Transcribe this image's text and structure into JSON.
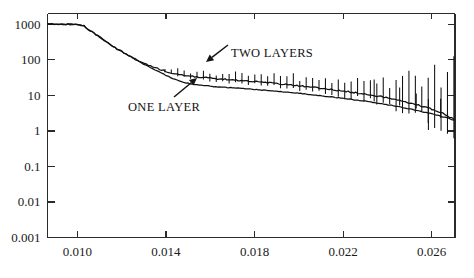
{
  "chart_data": {
    "type": "line",
    "title": "",
    "subtitle": "",
    "xlabel": "",
    "ylabel": "",
    "yscale": "log",
    "xscale": "linear",
    "xlim": [
      0.00865,
      0.02705
    ],
    "ylim": [
      0.001,
      2000
    ],
    "grid": false,
    "legend_position": "inline-annotations",
    "x_ticks": [
      "0.010",
      "0.014",
      "0.018",
      "0.022",
      "0.026"
    ],
    "x_tick_values": [
      0.01,
      0.014,
      0.018,
      0.022,
      0.026
    ],
    "y_ticks": [
      "1000",
      "100",
      "10",
      "1",
      "0.1",
      "0.01",
      "0.001"
    ],
    "y_tick_values": [
      1000,
      100,
      10,
      1,
      0.1,
      0.01,
      0.001
    ],
    "annotations": [
      {
        "text": "ONE LAYER",
        "x": 0.0152,
        "y": 3.4
      },
      {
        "text": "TWO LAYERS",
        "x": 0.0196,
        "y": 175
      }
    ],
    "series": [
      {
        "name": "TWO LAYERS",
        "has_error_bars": true,
        "x": [
          0.00868,
          0.00905,
          0.0094,
          0.00975,
          0.01,
          0.01015,
          0.0103,
          0.0105,
          0.01075,
          0.011,
          0.0113,
          0.0116,
          0.0119,
          0.0122,
          0.0125,
          0.0128,
          0.0131,
          0.0134,
          0.0137,
          0.014,
          0.0143,
          0.0146,
          0.0149,
          0.0152,
          0.0156,
          0.016,
          0.0165,
          0.017,
          0.0175,
          0.018,
          0.0185,
          0.019,
          0.0195,
          0.02,
          0.0206,
          0.0212,
          0.0218,
          0.0224,
          0.023,
          0.0236,
          0.0242,
          0.0248,
          0.0254,
          0.026,
          0.0266,
          0.027
        ],
        "y": [
          1000,
          1000,
          1000,
          1000,
          1000,
          960,
          880,
          720,
          560,
          430,
          320,
          240,
          185,
          145,
          115,
          93,
          76,
          63,
          54,
          47,
          42,
          38.5,
          36,
          34,
          32,
          30.5,
          29,
          27.5,
          26,
          24.5,
          23,
          21.5,
          20,
          18.5,
          16.8,
          15.2,
          13.6,
          12.2,
          10.8,
          9.4,
          8.0,
          6.6,
          5.3,
          4.1,
          2.9,
          2.1
        ],
        "yerr_lo": [
          0,
          0,
          0,
          0,
          0,
          0,
          0,
          0,
          0,
          0,
          0,
          0,
          0,
          0,
          0,
          0,
          0,
          0,
          0,
          0,
          0.08,
          0.08,
          0.09,
          0.09,
          0.1,
          0.1,
          0.11,
          0.11,
          0.12,
          0.12,
          0.14,
          0.14,
          0.16,
          0.16,
          0.18,
          0.18,
          0.2,
          0.22,
          0.24,
          0.26,
          0.3,
          0.34,
          0.4,
          0.48,
          0.58,
          0.7
        ],
        "yerr_hi": [
          0,
          0,
          0,
          0,
          0,
          0,
          0,
          0,
          0,
          0,
          0,
          0,
          0,
          0,
          0,
          0,
          0,
          0,
          0,
          0,
          0.12,
          0.12,
          0.13,
          0.13,
          0.14,
          0.14,
          0.16,
          0.16,
          0.18,
          0.18,
          0.2,
          0.2,
          0.24,
          0.24,
          0.28,
          0.28,
          0.32,
          0.36,
          0.4,
          0.44,
          0.52,
          0.6,
          0.72,
          0.88,
          1.05,
          1.3
        ]
      },
      {
        "name": "ONE LAYER",
        "has_error_bars": false,
        "x": [
          0.00868,
          0.00905,
          0.0094,
          0.00975,
          0.01,
          0.01015,
          0.0103,
          0.0105,
          0.01075,
          0.011,
          0.0113,
          0.0116,
          0.0119,
          0.0122,
          0.0125,
          0.0128,
          0.0131,
          0.0134,
          0.0137,
          0.014,
          0.0143,
          0.0146,
          0.0149,
          0.0152,
          0.0156,
          0.016,
          0.0165,
          0.017,
          0.0175,
          0.018,
          0.0185,
          0.019,
          0.0195,
          0.02,
          0.0206,
          0.0212,
          0.0218,
          0.0224,
          0.023,
          0.0236,
          0.0242,
          0.0248,
          0.0254,
          0.026,
          0.0266,
          0.027
        ],
        "y": [
          1000,
          1000,
          1000,
          1000,
          1000,
          960,
          880,
          720,
          560,
          430,
          320,
          240,
          185,
          143,
          112,
          88,
          70,
          56,
          45,
          36.5,
          30,
          25.5,
          22.5,
          20.5,
          19.0,
          18.0,
          17.0,
          16.2,
          15.4,
          14.6,
          13.8,
          13.0,
          12.2,
          11.4,
          10.4,
          9.4,
          8.5,
          7.6,
          6.8,
          6.0,
          5.2,
          4.4,
          3.7,
          3.0,
          2.4,
          2.0
        ]
      }
    ]
  },
  "annotations": {
    "one_layer": {
      "label": "ONE LAYER",
      "arrow_tail": {
        "x": 174,
        "y": 97
      },
      "arrow_tip": {
        "x": 197,
        "y": 78
      }
    },
    "two_layers": {
      "label": "TWO LAYERS",
      "arrow_tail": {
        "x": 228,
        "y": 45
      },
      "arrow_tip": {
        "x": 206,
        "y": 62
      }
    }
  },
  "axes": {
    "frame_color": "#2b2b2b",
    "curve_color": "#111111",
    "background": "#ffffff"
  }
}
